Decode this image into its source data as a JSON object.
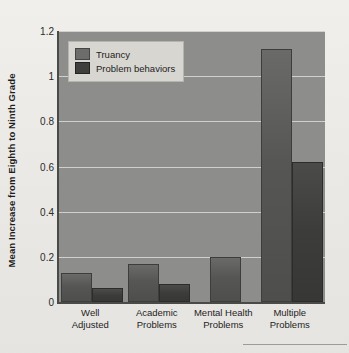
{
  "chart_data": {
    "type": "bar",
    "title": "",
    "xlabel": "",
    "ylabel": "Mean Increase from Eighth to Ninth Grade",
    "ylim": [
      0,
      1.2
    ],
    "yticks": [
      "0",
      "0.2",
      "0.4",
      "0.6",
      "0.8",
      "1",
      "1.2"
    ],
    "ytick_values": [
      0,
      0.2,
      0.4,
      0.6,
      0.8,
      1,
      1.2
    ],
    "grid": true,
    "legend_position": "top-left",
    "categories": [
      "Well\nAdjusted",
      "Academic\nProblems",
      "Mental Health\nProblems",
      "Multiple\nProblems"
    ],
    "category_lines": [
      [
        "Well",
        "Adjusted"
      ],
      [
        "Academic",
        "Problems"
      ],
      [
        "Mental Health",
        "Problems"
      ],
      [
        "Multiple",
        "Problems"
      ]
    ],
    "series": [
      {
        "name": "Truancy",
        "color": "#565654",
        "values": [
          0.13,
          0.17,
          0.2,
          1.12
        ]
      },
      {
        "name": "Problem behaviors",
        "color": "#3c3c3a",
        "values": [
          0.06,
          0.08,
          0.0,
          0.62
        ]
      }
    ]
  },
  "legend": {
    "items": [
      {
        "label": "Truancy"
      },
      {
        "label": "Problem behaviors"
      }
    ]
  },
  "colors": {
    "page_background": "#eeece8",
    "plot_background": "#8d8d8b",
    "gridline": "#dedcd6",
    "axis": "#4a4a48",
    "truancy": "#565654",
    "problem_behaviors": "#3c3c3a"
  }
}
